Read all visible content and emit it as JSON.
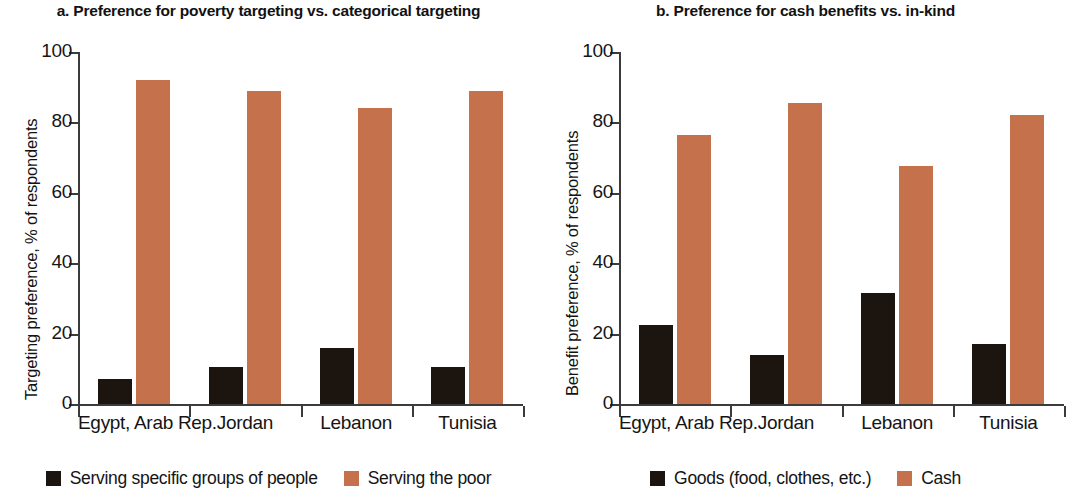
{
  "colors": {
    "dark": "#1c140f",
    "accent": "#c4714c",
    "axis": "#3b3b3b",
    "text": "#141414",
    "background": "#ffffff"
  },
  "panels": [
    {
      "id": "panel-a",
      "title": "a. Preference for poverty targeting vs. categorical targeting",
      "y_axis_title": "Targeting preference, % of respondents",
      "legend": [
        {
          "label": "Serving specific groups of people",
          "color_key": "dark"
        },
        {
          "label": "Serving the poor",
          "color_key": "accent"
        }
      ]
    },
    {
      "id": "panel-b",
      "title": "b. Preference for cash benefits vs. in-kind",
      "y_axis_title": "Benefit preference, % of respondents",
      "legend": [
        {
          "label": "Goods (food, clothes, etc.)",
          "color_key": "dark"
        },
        {
          "label": "Cash",
          "color_key": "accent"
        }
      ]
    }
  ],
  "chart_data": [
    {
      "type": "bar",
      "title": "a. Preference for poverty targeting vs. categorical targeting",
      "xlabel": "",
      "ylabel": "Targeting preference, % of respondents",
      "ylim": [
        0,
        100
      ],
      "yticks": [
        0,
        20,
        40,
        60,
        80,
        100
      ],
      "grid": false,
      "legend_position": "bottom",
      "categories": [
        "Egypt, Arab Rep.",
        "Jordan",
        "Lebanon",
        "Tunisia"
      ],
      "series": [
        {
          "name": "Serving specific groups of people",
          "color": "#1c140f",
          "values": [
            7,
            10.5,
            16,
            10.5
          ]
        },
        {
          "name": "Serving the poor",
          "color": "#c4714c",
          "values": [
            92,
            89,
            84,
            89
          ]
        }
      ]
    },
    {
      "type": "bar",
      "title": "b. Preference for cash benefits vs. in-kind",
      "xlabel": "",
      "ylabel": "Benefit preference, % of respondents",
      "ylim": [
        0,
        100
      ],
      "yticks": [
        0,
        20,
        40,
        60,
        80,
        100
      ],
      "grid": false,
      "legend_position": "bottom",
      "categories": [
        "Egypt, Arab Rep.",
        "Jordan",
        "Lebanon",
        "Tunisia"
      ],
      "series": [
        {
          "name": "Goods (food, clothes, etc.)",
          "color": "#1c140f",
          "values": [
            22.5,
            14,
            31.5,
            17
          ]
        },
        {
          "name": "Cash",
          "color": "#c4714c",
          "values": [
            76.5,
            85.5,
            67.5,
            82
          ]
        }
      ]
    }
  ],
  "ytick_labels": [
    "0",
    "20",
    "40",
    "60",
    "80",
    "100"
  ]
}
